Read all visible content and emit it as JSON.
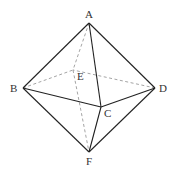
{
  "figure": {
    "type": "octahedron",
    "vertices": {
      "A": {
        "label": "A",
        "x": 89,
        "y": 23
      },
      "B": {
        "label": "B",
        "x": 23,
        "y": 88
      },
      "C": {
        "label": "C",
        "x": 101,
        "y": 107
      },
      "D": {
        "label": "D",
        "x": 155,
        "y": 88
      },
      "E": {
        "label": "E",
        "x": 73,
        "y": 70
      },
      "F": {
        "label": "F",
        "x": 89,
        "y": 152
      }
    },
    "solid_edges": [
      "AB",
      "AC",
      "AD",
      "BC",
      "CD",
      "BF",
      "CF",
      "DF"
    ],
    "dashed_edges": [
      "AE",
      "BE",
      "DE",
      "EF"
    ],
    "colors": {
      "solid": "#222222",
      "dashed": "#999999"
    }
  }
}
